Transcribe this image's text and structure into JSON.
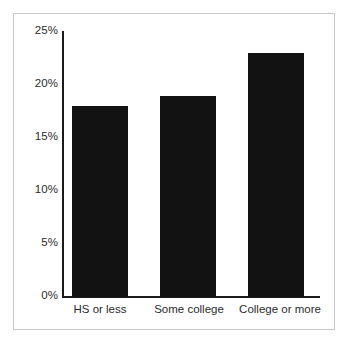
{
  "chart_data": {
    "type": "bar",
    "title": "",
    "subtitle": "",
    "xlabel": "",
    "ylabel": "",
    "categories": [
      "HS or less",
      "Some college",
      "College or more"
    ],
    "values": [
      18,
      19,
      23
    ],
    "value_labels": [
      "18%",
      "19%",
      "23%"
    ],
    "ylim": [
      0,
      25
    ],
    "yticks": [
      0,
      5,
      10,
      15,
      20,
      25
    ],
    "ytick_labels": [
      "0%",
      "5%",
      "10%",
      "15%",
      "20%",
      "25%"
    ],
    "grid": false,
    "legend": null,
    "legend_position": "none",
    "series": [
      {
        "name": "",
        "values": [
          18,
          19,
          23
        ],
        "color": "#121212"
      }
    ],
    "annotations": []
  },
  "axes": {
    "y_axis_name": "percent-axis",
    "x_axis_name": "education-category-axis"
  },
  "colors": {
    "bar": "#121212",
    "axis": "#1a1a1a",
    "frame": "#c9c9c9",
    "text": "#2b2b2b",
    "background": "#ffffff"
  }
}
